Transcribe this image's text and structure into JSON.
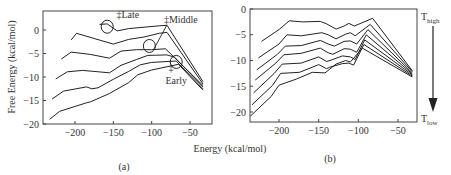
{
  "figure": {
    "shared_xlabel": "Energy (kcal/mol)",
    "shared_ylabel": "Free Energy (kcal/mol)"
  },
  "chart_data": [
    {
      "id": "a",
      "type": "line",
      "panel_label": "(a)",
      "title": "",
      "xlabel": "Energy (kcal/mol)",
      "ylabel": "Free Energy (kcal/mol)",
      "xlim": [
        -242,
        -25
      ],
      "ylim": [
        -20,
        4
      ],
      "xticks": [
        -200,
        -150,
        -100,
        -50
      ],
      "xtick_labels": [
        "−200",
        "−150",
        "−100",
        "−50"
      ],
      "yticks": [
        0,
        -5,
        -10,
        -15,
        -20
      ],
      "ytick_labels": [
        "0",
        "−5",
        "−10",
        "−15",
        "−20"
      ],
      "grid": false,
      "legend": null,
      "series": [
        {
          "name": "curve 1 (top)",
          "x": [
            -168,
            -158,
            -145,
            -130,
            -110,
            -90,
            -80,
            -33
          ],
          "y": [
            1.2,
            1.3,
            -0.2,
            0.3,
            0.6,
            0.9,
            1.0,
            -11.0
          ]
        },
        {
          "name": "curve 2",
          "x": [
            -205,
            -198,
            -175,
            -150,
            -130,
            -110,
            -90,
            -80,
            -33
          ],
          "y": [
            -2.1,
            -0.7,
            -1.8,
            -3.0,
            -2.0,
            -1.5,
            -0.7,
            -0.5,
            -11.5
          ]
        },
        {
          "name": "curve 3",
          "x": [
            -218,
            -205,
            -180,
            -155,
            -140,
            -120,
            -100,
            -82,
            -33
          ],
          "y": [
            -6.2,
            -4.7,
            -5.2,
            -6.0,
            -4.5,
            -4.2,
            -4.2,
            -4.0,
            -11.8
          ]
        },
        {
          "name": "curve 4",
          "x": [
            -225,
            -210,
            -190,
            -155,
            -140,
            -120,
            -105,
            -80,
            -70,
            -33
          ],
          "y": [
            -10.4,
            -8.9,
            -8.6,
            -9.1,
            -7.5,
            -6.3,
            -5.4,
            -5.3,
            -5.8,
            -12.1
          ]
        },
        {
          "name": "curve 5",
          "x": [
            -230,
            -215,
            -185,
            -178,
            -170,
            -150,
            -130,
            -115,
            -100,
            -68,
            -33
          ],
          "y": [
            -14.7,
            -13.0,
            -12.1,
            -12.5,
            -12.3,
            -10.5,
            -8.8,
            -7.4,
            -6.9,
            -6.6,
            -12.5
          ]
        },
        {
          "name": "curve 6 (bottom)",
          "x": [
            -233,
            -220,
            -185,
            -180,
            -155,
            -130,
            -118,
            -100,
            -65,
            -33
          ],
          "y": [
            -19.0,
            -17.3,
            -15.5,
            -15.3,
            -13.5,
            -11.2,
            -9.5,
            -8.5,
            -7.3,
            -12.8
          ]
        }
      ],
      "annotations": [
        {
          "text": "‡Late",
          "x": -146,
          "y": 2.6,
          "circle_at": [
            -158,
            0.7
          ]
        },
        {
          "text": "‡Middle",
          "x": -84,
          "y": 1.5,
          "circle_at": [
            -103,
            -3.4
          ],
          "pointer_line": true
        },
        {
          "text": "‡",
          "x": -78,
          "y": -8.8,
          "circle_at": [
            -68,
            -6.8
          ]
        },
        {
          "text": "Early",
          "x": -82,
          "y": -11.5
        }
      ]
    },
    {
      "id": "b",
      "type": "line",
      "panel_label": "(b)",
      "title": "",
      "xlabel": "Energy (kcal/mol)",
      "ylabel": "Free Energy (kcal/mol)",
      "xlim": [
        -237,
        -27
      ],
      "ylim": [
        -22,
        0
      ],
      "xticks": [
        -200,
        -150,
        -100,
        -50
      ],
      "xtick_labels": [
        "−200",
        "−150",
        "−100",
        "−50"
      ],
      "yticks": [
        0,
        -5,
        -10,
        -15,
        -20
      ],
      "ytick_labels": [
        "0",
        "−5",
        "−10",
        "−15",
        "−20"
      ],
      "grid": false,
      "legend": null,
      "temperature_arrow": {
        "top_label": "T",
        "top_sub": "high",
        "bottom_label": "T",
        "bottom_sub": "low",
        "direction": "down"
      },
      "series": [
        {
          "name": "T1 (highest)",
          "x": [
            -222,
            -200,
            -187,
            -170,
            -148,
            -140,
            -128,
            -118,
            -112,
            -105,
            -82,
            -32
          ],
          "y": [
            -6.3,
            -4.0,
            -2.3,
            -2.5,
            -2.4,
            -2.9,
            -3.9,
            -3.3,
            -2.8,
            -3.3,
            -1.8,
            -12.0
          ]
        },
        {
          "name": "T2",
          "x": [
            -226,
            -200,
            -190,
            -172,
            -146,
            -138,
            -128,
            -116,
            -110,
            -104,
            -85,
            -32
          ],
          "y": [
            -9.5,
            -6.8,
            -5.0,
            -5.2,
            -4.6,
            -5.0,
            -5.8,
            -4.9,
            -4.6,
            -5.2,
            -3.0,
            -12.2
          ]
        },
        {
          "name": "T3",
          "x": [
            -228,
            -202,
            -192,
            -172,
            -148,
            -138,
            -130,
            -118,
            -110,
            -102,
            -88,
            -32
          ],
          "y": [
            -11.8,
            -8.8,
            -7.2,
            -7.1,
            -6.1,
            -6.8,
            -7.2,
            -6.3,
            -6.2,
            -6.8,
            -4.0,
            -12.4
          ]
        },
        {
          "name": "T4",
          "x": [
            -230,
            -204,
            -194,
            -172,
            -148,
            -138,
            -132,
            -118,
            -110,
            -102,
            -90,
            -32
          ],
          "y": [
            -13.8,
            -10.5,
            -8.9,
            -8.6,
            -7.6,
            -8.5,
            -8.8,
            -7.7,
            -7.8,
            -8.4,
            -5.0,
            -12.6
          ]
        },
        {
          "name": "T5",
          "x": [
            -232,
            -206,
            -196,
            -172,
            -150,
            -140,
            -134,
            -120,
            -110,
            -104,
            -92,
            -32
          ],
          "y": [
            -16.3,
            -12.5,
            -10.7,
            -10.5,
            -9.3,
            -10.2,
            -9.9,
            -9.1,
            -9.3,
            -9.8,
            -6.0,
            -12.8
          ]
        },
        {
          "name": "T6",
          "x": [
            -234,
            -208,
            -198,
            -174,
            -150,
            -140,
            -136,
            -120,
            -112,
            -106,
            -93,
            -32
          ],
          "y": [
            -18.6,
            -14.8,
            -12.5,
            -12.3,
            -10.8,
            -11.6,
            -11.3,
            -10.6,
            -10.5,
            -10.9,
            -6.9,
            -13.0
          ]
        },
        {
          "name": "T7 (lowest)",
          "x": [
            -236,
            -210,
            -200,
            -178,
            -158,
            -142,
            -128,
            -116,
            -110,
            -95,
            -32
          ],
          "y": [
            -20.8,
            -17.0,
            -14.8,
            -13.6,
            -12.3,
            -12.4,
            -10.7,
            -10.0,
            -10.3,
            -7.6,
            -13.2
          ]
        }
      ]
    }
  ]
}
